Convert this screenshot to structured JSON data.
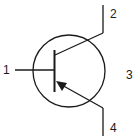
{
  "diagram": {
    "type": "PNP transistor symbol",
    "colors": {
      "line": "#1a1a1a",
      "background": "#ffffff"
    },
    "terminals": [
      {
        "id": "1",
        "label": "1",
        "role": "base"
      },
      {
        "id": "2",
        "label": "2",
        "role": "collector"
      },
      {
        "id": "3",
        "label": "3",
        "role": "envelope"
      },
      {
        "id": "4",
        "label": "4",
        "role": "emitter"
      }
    ]
  }
}
